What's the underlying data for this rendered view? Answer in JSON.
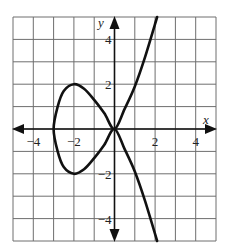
{
  "chart_data": {
    "type": "line",
    "title": "",
    "xlabel": "x",
    "ylabel": "y",
    "xlim": [
      -5,
      5
    ],
    "ylim": [
      -5,
      5
    ],
    "grid": true,
    "grid_step": 1,
    "x_tick_labels": [
      "-4",
      "-2",
      "2",
      "4"
    ],
    "y_tick_labels": [
      "4",
      "2",
      "-2",
      "-4"
    ],
    "series": [
      {
        "name": "curve (loop with crossing at origin)",
        "points": [
          [
            2.1,
            5
          ],
          [
            1.5,
            3.2
          ],
          [
            1,
            1.9
          ],
          [
            0.5,
            0.9
          ],
          [
            0,
            0
          ],
          [
            -0.5,
            0.7
          ],
          [
            -1,
            1.3
          ],
          [
            -1.5,
            1.8
          ],
          [
            -2,
            2
          ],
          [
            -2.5,
            1.7
          ],
          [
            -2.8,
            1
          ],
          [
            -3,
            0
          ],
          [
            -2.8,
            -1
          ],
          [
            -2.5,
            -1.7
          ],
          [
            -2,
            -2
          ],
          [
            -1.5,
            -1.8
          ],
          [
            -1,
            -1.3
          ],
          [
            -0.5,
            -0.7
          ],
          [
            0,
            0
          ],
          [
            0.5,
            -0.9
          ],
          [
            1,
            -1.9
          ],
          [
            1.5,
            -3.2
          ],
          [
            2.1,
            -5
          ]
        ]
      }
    ],
    "annotations": {
      "crossing_point": [
        0,
        0
      ],
      "loop_leftmost": [
        -3,
        0
      ],
      "loop_top": [
        -2,
        2
      ],
      "loop_bottom": [
        -2,
        -2
      ]
    }
  },
  "labels": {
    "x_axis": "x",
    "y_axis": "y",
    "x_ticks": [
      "−4",
      "−2",
      "2",
      "4"
    ],
    "y_ticks": [
      "4",
      "2",
      "−2",
      "−4"
    ]
  }
}
